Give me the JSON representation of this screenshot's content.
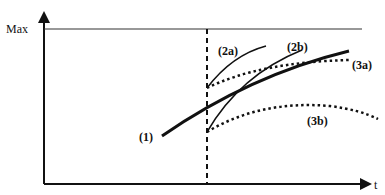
{
  "diagram": {
    "y_axis_label": "Max",
    "x_axis_label": "t",
    "curves": [
      {
        "id": "1",
        "label": "(1)",
        "style": "solid-thick"
      },
      {
        "id": "2a",
        "label": "(2a)",
        "style": "solid"
      },
      {
        "id": "2b",
        "label": "(2b)",
        "style": "solid"
      },
      {
        "id": "3a",
        "label": "(3a)",
        "style": "dotted"
      },
      {
        "id": "3b",
        "label": "(3b)",
        "style": "dotted"
      }
    ],
    "colors": {
      "line": "#111111",
      "background": "#ffffff"
    }
  }
}
